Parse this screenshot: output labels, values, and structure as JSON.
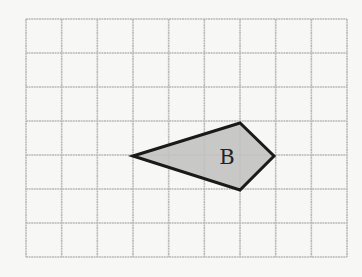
{
  "diagram": {
    "type": "grid-with-polygon",
    "background": "#f7f7f5",
    "grid": {
      "columns": 9,
      "rows": 7,
      "origin_px": [
        26,
        19
      ],
      "cell_width_px": 35.67,
      "cell_height_px": 34,
      "line_color": "#b9b9b9"
    },
    "shape": {
      "name": "kite",
      "label": "B",
      "fill": "#c2c2c2",
      "stroke": "#1a1a1a",
      "vertices_grid": [
        [
          3,
          4
        ],
        [
          6,
          3
        ],
        [
          7,
          4
        ],
        [
          6,
          5
        ]
      ],
      "vertices_px": [
        [
          133,
          156
        ],
        [
          240,
          123
        ],
        [
          274,
          156
        ],
        [
          240,
          190
        ]
      ],
      "label_position_px": [
        227,
        164
      ]
    }
  }
}
